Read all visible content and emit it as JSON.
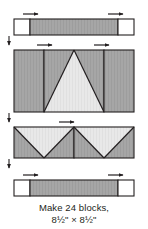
{
  "diagram": {
    "colors": {
      "outline": "#231f20",
      "dark_fabric": "#a6a6a6",
      "light_fabric": "#e6e6e6",
      "background_fabric": "#ffffff",
      "arrow": "#231f20",
      "page_background": "#ffffff"
    },
    "rows": [
      {
        "name": "top-sashing-row",
        "label": "Top row: corner square, sashing strip, corner square",
        "units": [
          {
            "name": "corner-square-left",
            "fill": "background_fabric"
          },
          {
            "name": "sashing-strip-top",
            "fill": "dark_fabric"
          },
          {
            "name": "corner-square-right",
            "fill": "background_fabric"
          }
        ],
        "pressing_arrows": [
          {
            "name": "pressing-arrow-top-left",
            "direction": "right"
          },
          {
            "name": "pressing-arrow-top-right",
            "direction": "right"
          }
        ]
      },
      {
        "name": "upper-center-row",
        "label": "Second row: side rectangle, flying-geese peak unit, side rectangle",
        "units": [
          {
            "name": "side-rectangle-left",
            "fill": "dark_fabric"
          },
          {
            "name": "center-peak-triangle-unit",
            "fill": "light_fabric"
          },
          {
            "name": "side-rectangle-right",
            "fill": "dark_fabric"
          }
        ],
        "pressing_arrows": [
          {
            "name": "pressing-arrow-row2-left",
            "direction": "right"
          },
          {
            "name": "pressing-arrow-row2-right",
            "direction": "right"
          }
        ]
      },
      {
        "name": "lower-center-row",
        "label": "Third row: two inverted flying-geese units side by side",
        "units": [
          {
            "name": "inverted-geese-unit-left",
            "fill": "light_fabric"
          },
          {
            "name": "inverted-geese-unit-right",
            "fill": "light_fabric"
          }
        ],
        "pressing_arrows": [
          {
            "name": "pressing-arrow-row3-center",
            "direction": "right"
          }
        ]
      },
      {
        "name": "bottom-sashing-row",
        "label": "Bottom row: corner square, sashing strip, corner square",
        "units": [
          {
            "name": "corner-square-left",
            "fill": "background_fabric"
          },
          {
            "name": "sashing-strip-bottom",
            "fill": "dark_fabric"
          },
          {
            "name": "corner-square-right",
            "fill": "background_fabric"
          }
        ],
        "pressing_arrows": [
          {
            "name": "pressing-arrow-bottom-left",
            "direction": "right"
          },
          {
            "name": "pressing-arrow-bottom-right",
            "direction": "right"
          }
        ]
      }
    ],
    "join_arrows": [
      {
        "name": "join-arrow-row1-row2",
        "direction": "down"
      },
      {
        "name": "join-arrow-row2-row3",
        "direction": "down"
      },
      {
        "name": "join-arrow-row3-row4",
        "direction": "down"
      }
    ]
  },
  "caption": {
    "line1": "Make 24 blocks,",
    "line2": "8½\" × 8½\"",
    "block_count": 24,
    "finished_size": "8½\" × 8½\""
  }
}
